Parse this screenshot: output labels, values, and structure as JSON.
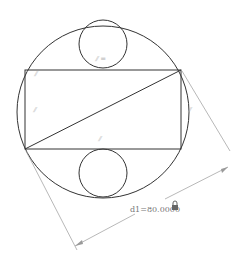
{
  "diagram": {
    "type": "cad-sketch",
    "shapes": {
      "outer_circle": {
        "cx": 103,
        "cy": 112,
        "r": 86
      },
      "top_circle": {
        "cx": 103,
        "cy": 44,
        "r": 24
      },
      "bottom_circle": {
        "cx": 103,
        "cy": 166,
        "r": 24
      },
      "rectangle": {
        "x1": 25,
        "y1": 70,
        "x2": 181,
        "y2": 149
      },
      "diagonal": {
        "from": "bottom-left",
        "to": "top-right"
      }
    },
    "constraints": {
      "top_circle_label": "⫽ =",
      "parallel_top_left": "⫽",
      "parallel_left": "⫽",
      "parallel_right": "⫽",
      "parallel_diagonal": "⫽"
    },
    "dimension": {
      "label": "d1=80.0000",
      "locked_icon": "lock-icon",
      "color": "#777777"
    }
  }
}
